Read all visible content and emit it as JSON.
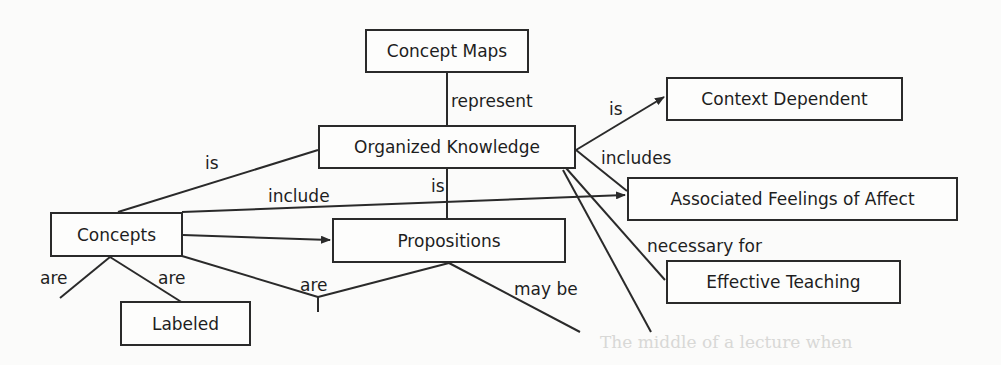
{
  "nodes": {
    "concept_maps": "Concept Maps",
    "organized_knowledge": "Organized Knowledge",
    "context_dependent": "Context Dependent",
    "associated_feelings": "Associated Feelings of Affect",
    "concepts": "Concepts",
    "propositions": "Propositions",
    "effective_teaching": "Effective Teaching",
    "labeled": "Labeled"
  },
  "links": {
    "represent": "represent",
    "is_context": "is",
    "includes": "includes",
    "is_concepts": "is",
    "include": "include",
    "is_propositions": "is",
    "necessary_for": "necessary for",
    "are_left": "are",
    "are_labeled": "are",
    "are_mid": "are",
    "may_be": "may be"
  },
  "bleed_text": "The middle of a lecture when"
}
